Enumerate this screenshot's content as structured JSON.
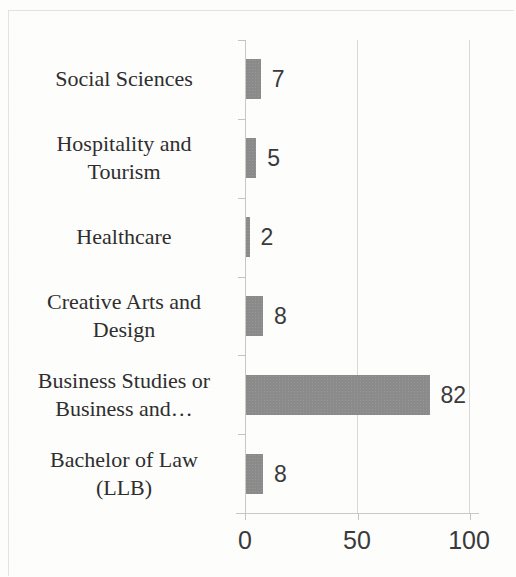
{
  "chart_data": {
    "type": "bar",
    "orientation": "horizontal",
    "title": "",
    "subtitle": "",
    "xlabel": "",
    "ylabel": "",
    "xlim": [
      0,
      100
    ],
    "xticks": [
      "0",
      "50",
      "100"
    ],
    "xtick_values": [
      0,
      50,
      100
    ],
    "grid": "vertical",
    "legend": "none",
    "bar_color": "#8b8b8b",
    "data_labels_shown": true,
    "categories": [
      "Social Sciences",
      "Hospitality and Tourism",
      "Healthcare",
      "Creative Arts and Design",
      "Business Studies or Business and…",
      "Bachelor of Law (LLB)"
    ],
    "category_lines": [
      [
        "Social Sciences"
      ],
      [
        "Hospitality and",
        "Tourism"
      ],
      [
        "Healthcare"
      ],
      [
        "Creative Arts and",
        "Design"
      ],
      [
        "Business Studies or",
        "Business and…"
      ],
      [
        "Bachelor of Law",
        "(LLB)"
      ]
    ],
    "values": [
      7,
      5,
      2,
      8,
      82,
      8
    ],
    "value_labels": [
      "7",
      "5",
      "2",
      "8",
      "82",
      "8"
    ]
  },
  "axis": {
    "tick_0": "0",
    "tick_50": "50",
    "tick_100": "100"
  },
  "colors": {
    "bar": "#8b8b8b",
    "gridline": "#d8d8d6",
    "axis": "#c8c8c6",
    "text": "#2e2e2e",
    "background": "#fdfdfc"
  }
}
